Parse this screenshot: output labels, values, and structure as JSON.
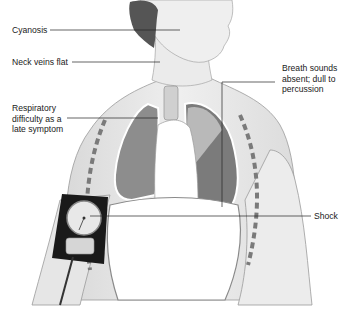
{
  "diagram": {
    "labels": {
      "cyanosis": "Cyanosis",
      "neck_veins": "Neck veins flat",
      "respiratory": "Respiratory\ndifficulty as a\nlate symptom",
      "breath_sounds": "Breath sounds\nabsent; dull to\npercussion",
      "shock": "Shock"
    }
  }
}
